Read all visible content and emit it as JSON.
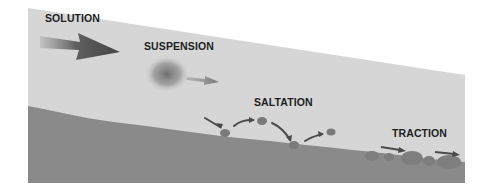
{
  "diagram": {
    "labels": {
      "solution": "SOLUTION",
      "suspension": "SUSPENSION",
      "saltation": "SALTATION",
      "traction": "TRACTION"
    },
    "colors": {
      "background": "#ffffff",
      "water": "#d6d6d6",
      "ground": "#8a8a8a",
      "arrow": "#4a4a4a",
      "particle": "#7a7a7a",
      "text": "#1e1e1e"
    }
  }
}
